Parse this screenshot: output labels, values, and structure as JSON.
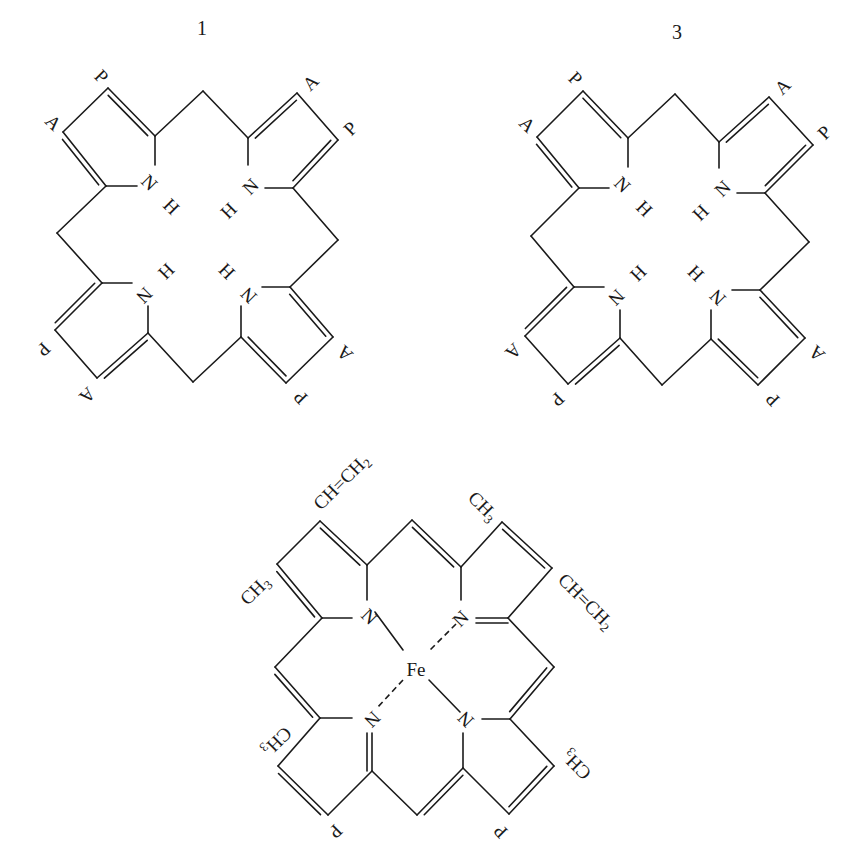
{
  "figure": {
    "structures": [
      {
        "id": "uroporphyrin-1",
        "number_label": "1",
        "number_pos": [
          202,
          30
        ],
        "type": "porphyrin",
        "inner_atoms": [
          {
            "text": "N",
            "x": 148,
            "y": 184,
            "rot": 45
          },
          {
            "text": "H",
            "x": 170,
            "y": 208,
            "rot": 45
          },
          {
            "text": "N",
            "x": 252,
            "y": 188,
            "rot": -45
          },
          {
            "text": "H",
            "x": 230,
            "y": 212,
            "rot": -45
          },
          {
            "text": "N",
            "x": 143,
            "y": 294,
            "rot": 135
          },
          {
            "text": "H",
            "x": 165,
            "y": 270,
            "rot": 135
          },
          {
            "text": "N",
            "x": 250,
            "y": 294,
            "rot": -135
          },
          {
            "text": "H",
            "x": 228,
            "y": 270,
            "rot": -135
          }
        ],
        "substituents": [
          {
            "text": "P",
            "x": 100,
            "y": 78,
            "rot": 45
          },
          {
            "text": "A",
            "x": 52,
            "y": 124,
            "rot": 45
          },
          {
            "text": "A",
            "x": 312,
            "y": 84,
            "rot": -45
          },
          {
            "text": "P",
            "x": 352,
            "y": 130,
            "rot": -45
          },
          {
            "text": "P",
            "x": 42,
            "y": 348,
            "rot": 135
          },
          {
            "text": "A",
            "x": 86,
            "y": 394,
            "rot": 135
          },
          {
            "text": "A",
            "x": 346,
            "y": 352,
            "rot": -135
          },
          {
            "text": "P",
            "x": 302,
            "y": 396,
            "rot": -135
          }
        ]
      },
      {
        "id": "uroporphyrin-3",
        "number_label": "3",
        "number_pos": [
          677,
          34
        ],
        "type": "porphyrin",
        "inner_atoms": [
          {
            "text": "N",
            "x": 621,
            "y": 186,
            "rot": 45
          },
          {
            "text": "H",
            "x": 643,
            "y": 210,
            "rot": 45
          },
          {
            "text": "N",
            "x": 724,
            "y": 190,
            "rot": -45
          },
          {
            "text": "H",
            "x": 702,
            "y": 214,
            "rot": -45
          },
          {
            "text": "N",
            "x": 615,
            "y": 296,
            "rot": 135
          },
          {
            "text": "H",
            "x": 637,
            "y": 272,
            "rot": 135
          },
          {
            "text": "N",
            "x": 719,
            "y": 296,
            "rot": -135
          },
          {
            "text": "H",
            "x": 697,
            "y": 272,
            "rot": -135
          }
        ],
        "substituents": [
          {
            "text": "P",
            "x": 574,
            "y": 80,
            "rot": 45
          },
          {
            "text": "A",
            "x": 526,
            "y": 126,
            "rot": 45
          },
          {
            "text": "A",
            "x": 784,
            "y": 88,
            "rot": -45
          },
          {
            "text": "P",
            "x": 826,
            "y": 134,
            "rot": -45
          },
          {
            "text": "A",
            "x": 512,
            "y": 350,
            "rot": 135
          },
          {
            "text": "P",
            "x": 556,
            "y": 398,
            "rot": 135
          },
          {
            "text": "A",
            "x": 818,
            "y": 352,
            "rot": -135
          },
          {
            "text": "P",
            "x": 774,
            "y": 398,
            "rot": -135
          }
        ]
      },
      {
        "id": "heme",
        "number_label": "",
        "type": "heme",
        "metal": {
          "text": "Fe",
          "x": 416,
          "y": 672
        },
        "inner_atoms": [
          {
            "text": "N",
            "x": 368,
            "y": 618,
            "rot": 45
          },
          {
            "text": "N",
            "x": 462,
            "y": 620,
            "rot": -45
          },
          {
            "text": "N",
            "x": 371,
            "y": 718,
            "rot": 135
          },
          {
            "text": "N",
            "x": 467,
            "y": 718,
            "rot": -135
          }
        ],
        "substituents": [
          {
            "text": "CH=CH",
            "sub": "2",
            "x": 318,
            "y": 508,
            "rot": -45,
            "anchor": "start"
          },
          {
            "text": "CH",
            "sub": "3",
            "x": 470,
            "y": 496,
            "rot": 45,
            "anchor": "start"
          },
          {
            "text": "CH",
            "sub": "3",
            "x": 268,
            "y": 580,
            "rot": -45,
            "anchor": "end"
          },
          {
            "text": "CH=CH",
            "sub": "2",
            "x": 560,
            "y": 578,
            "rot": 45,
            "anchor": "start"
          },
          {
            "text": "CH",
            "sub": "3",
            "x": 264,
            "y": 752,
            "rot": 135,
            "anchor": "end"
          },
          {
            "text": "CH",
            "sub": "3",
            "x": 566,
            "y": 752,
            "rot": -135,
            "anchor": "end"
          },
          {
            "text": "P",
            "x": 334,
            "y": 830,
            "rot": 135,
            "anchor": "middle"
          },
          {
            "text": "P",
            "x": 502,
            "y": 830,
            "rot": -135,
            "anchor": "middle"
          }
        ]
      }
    ],
    "legend": {
      "A": "acetate side chain",
      "P": "propionate side chain"
    }
  },
  "geometry": {
    "p1": {
      "single": [
        [
          [
            155,
            136
          ],
          [
            203,
            91
          ]
        ],
        [
          [
            203,
            91
          ],
          [
            248,
            138
          ]
        ],
        [
          [
            108,
            88
          ],
          [
            63,
            132
          ]
        ],
        [
          [
            297,
            93
          ],
          [
            338,
            140
          ]
        ],
        [
          [
            106,
            186
          ],
          [
            57,
            233
          ]
        ],
        [
          [
            57,
            233
          ],
          [
            102,
            283
          ]
        ],
        [
          [
            293,
            188
          ],
          [
            338,
            240
          ]
        ],
        [
          [
            338,
            240
          ],
          [
            290,
            287
          ]
        ],
        [
          [
            55,
            330
          ],
          [
            97,
            378
          ]
        ],
        [
          [
            333,
            337
          ],
          [
            286,
            383
          ]
        ],
        [
          [
            148,
            333
          ],
          [
            193,
            382
          ]
        ],
        [
          [
            193,
            382
          ],
          [
            241,
            337
          ]
        ],
        [
          [
            155,
            136
          ],
          [
            155,
            165
          ]
        ],
        [
          [
            106,
            186
          ],
          [
            137,
            186
          ]
        ],
        [
          [
            248,
            138
          ],
          [
            248,
            165
          ]
        ],
        [
          [
            293,
            188
          ],
          [
            265,
            188
          ]
        ],
        [
          [
            102,
            283
          ],
          [
            132,
            283
          ]
        ],
        [
          [
            148,
            333
          ],
          [
            148,
            306
          ]
        ],
        [
          [
            290,
            287
          ],
          [
            262,
            287
          ]
        ],
        [
          [
            241,
            337
          ],
          [
            241,
            306
          ]
        ]
      ],
      "double": [
        [
          [
            108,
            88
          ],
          [
            155,
            136
          ]
        ],
        [
          [
            63,
            132
          ],
          [
            106,
            186
          ]
        ],
        [
          [
            248,
            138
          ],
          [
            297,
            93
          ]
        ],
        [
          [
            338,
            140
          ],
          [
            293,
            188
          ]
        ],
        [
          [
            102,
            283
          ],
          [
            55,
            330
          ]
        ],
        [
          [
            97,
            378
          ],
          [
            148,
            333
          ]
        ],
        [
          [
            290,
            287
          ],
          [
            333,
            337
          ]
        ],
        [
          [
            286,
            383
          ],
          [
            241,
            337
          ]
        ]
      ]
    },
    "p3": {
      "single": [
        [
          [
            628,
            138
          ],
          [
            675,
            94
          ]
        ],
        [
          [
            675,
            94
          ],
          [
            719,
            142
          ]
        ],
        [
          [
            583,
            91
          ],
          [
            537,
            137
          ]
        ],
        [
          [
            769,
            97
          ],
          [
            813,
            145
          ]
        ],
        [
          [
            579,
            188
          ],
          [
            531,
            236
          ]
        ],
        [
          [
            531,
            236
          ],
          [
            574,
            287
          ]
        ],
        [
          [
            765,
            193
          ],
          [
            809,
            242
          ]
        ],
        [
          [
            809,
            242
          ],
          [
            760,
            290
          ]
        ],
        [
          [
            525,
            336
          ],
          [
            568,
            384
          ]
        ],
        [
          [
            805,
            338
          ],
          [
            758,
            385
          ]
        ],
        [
          [
            620,
            338
          ],
          [
            662,
            385
          ]
        ],
        [
          [
            662,
            385
          ],
          [
            711,
            339
          ]
        ],
        [
          [
            628,
            138
          ],
          [
            628,
            167
          ]
        ],
        [
          [
            579,
            188
          ],
          [
            609,
            188
          ]
        ],
        [
          [
            719,
            142
          ],
          [
            719,
            168
          ]
        ],
        [
          [
            765,
            193
          ],
          [
            737,
            193
          ]
        ],
        [
          [
            574,
            287
          ],
          [
            604,
            287
          ]
        ],
        [
          [
            620,
            338
          ],
          [
            620,
            310
          ]
        ],
        [
          [
            760,
            290
          ],
          [
            732,
            290
          ]
        ],
        [
          [
            711,
            339
          ],
          [
            711,
            310
          ]
        ]
      ],
      "double": [
        [
          [
            583,
            91
          ],
          [
            628,
            138
          ]
        ],
        [
          [
            537,
            137
          ],
          [
            579,
            188
          ]
        ],
        [
          [
            719,
            142
          ],
          [
            769,
            97
          ]
        ],
        [
          [
            813,
            145
          ],
          [
            765,
            193
          ]
        ],
        [
          [
            574,
            287
          ],
          [
            525,
            336
          ]
        ],
        [
          [
            568,
            384
          ],
          [
            620,
            338
          ]
        ],
        [
          [
            760,
            290
          ],
          [
            805,
            338
          ]
        ],
        [
          [
            758,
            385
          ],
          [
            711,
            339
          ]
        ]
      ]
    },
    "heme": {
      "single": [
        [
          [
            320,
            521
          ],
          [
            277,
            564
          ]
        ],
        [
          [
            367,
            565
          ],
          [
            412,
            520
          ]
        ],
        [
          [
            461,
            567
          ],
          [
            502,
            522
          ]
        ],
        [
          [
            552,
            568
          ],
          [
            508,
            618
          ]
        ],
        [
          [
            322,
            618
          ],
          [
            275,
            667
          ]
        ],
        [
          [
            508,
            618
          ],
          [
            554,
            667
          ]
        ],
        [
          [
            320,
            718
          ],
          [
            278,
            766
          ]
        ],
        [
          [
            328,
            815
          ],
          [
            372,
            771
          ]
        ],
        [
          [
            372,
            771
          ],
          [
            417,
            815
          ]
        ],
        [
          [
            510,
            719
          ],
          [
            554,
            766
          ]
        ],
        [
          [
            509,
            814
          ],
          [
            463,
            768
          ]
        ],
        [
          [
            367,
            565
          ],
          [
            367,
            600
          ]
        ],
        [
          [
            322,
            618
          ],
          [
            352,
            618
          ]
        ],
        [
          [
            461,
            567
          ],
          [
            461,
            600
          ]
        ],
        [
          [
            320,
            718
          ],
          [
            352,
            718
          ]
        ],
        [
          [
            463,
            768
          ],
          [
            463,
            733
          ]
        ],
        [
          [
            510,
            719
          ],
          [
            482,
            719
          ]
        ],
        [
          [
            375,
            612
          ],
          [
            403,
            650
          ]
        ],
        [
          [
            429,
            680
          ],
          [
            460,
            712
          ]
        ]
      ],
      "double": [
        [
          [
            320,
            521
          ],
          [
            367,
            565
          ]
        ],
        [
          [
            277,
            564
          ],
          [
            322,
            618
          ]
        ],
        [
          [
            412,
            520
          ],
          [
            461,
            567
          ]
        ],
        [
          [
            502,
            522
          ],
          [
            552,
            568
          ]
        ],
        [
          [
            275,
            667
          ],
          [
            320,
            718
          ]
        ],
        [
          [
            554,
            667
          ],
          [
            510,
            719
          ]
        ],
        [
          [
            278,
            766
          ],
          [
            328,
            815
          ]
        ],
        [
          [
            417,
            815
          ],
          [
            463,
            768
          ]
        ],
        [
          [
            554,
            766
          ],
          [
            509,
            814
          ]
        ]
      ],
      "double_inner": [
        [
          [
            476,
            618
          ],
          [
            508,
            618
          ]
        ],
        [
          [
            372,
            733
          ],
          [
            372,
            771
          ]
        ]
      ],
      "dashed": [
        [
          [
            456,
            624
          ],
          [
            428,
            652
          ]
        ],
        [
          [
            403,
            680
          ],
          [
            377,
            708
          ]
        ]
      ]
    }
  }
}
